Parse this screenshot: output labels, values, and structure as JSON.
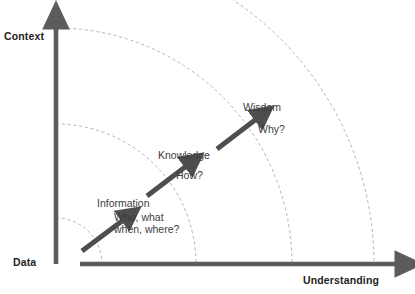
{
  "diagram": {
    "axes": {
      "y_label": "Context",
      "x_label": "Understanding",
      "origin_label": "Data"
    },
    "colors": {
      "axis": "#5c5c5c",
      "arrow": "#4e4e4e",
      "arc": "#a8a8a8",
      "text": "#3d3d3d",
      "axis_text": "#232323",
      "background": "#ffffff"
    },
    "stages": [
      {
        "name": "Data",
        "question": "",
        "question_lines": []
      },
      {
        "name": "Information",
        "question": "Who, what when, where?",
        "question_lines": [
          "Who, what",
          "when, where?"
        ]
      },
      {
        "name": "Knowledge",
        "question": "How?",
        "question_lines": [
          "How?"
        ]
      },
      {
        "name": "Wisdom",
        "question": "Why?",
        "question_lines": [
          "Why?"
        ]
      }
    ],
    "arcs": [
      {
        "radius": 46
      },
      {
        "radius": 140
      },
      {
        "radius": 236
      },
      {
        "radius": 318
      }
    ],
    "progress_arrows": [
      {
        "from_stage": "Data",
        "to_stage": "Information"
      },
      {
        "from_stage": "Information",
        "to_stage": "Knowledge"
      },
      {
        "from_stage": "Knowledge",
        "to_stage": "Wisdom"
      }
    ]
  }
}
